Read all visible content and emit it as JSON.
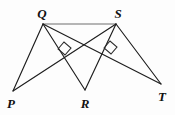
{
  "figure": {
    "background_color": "#fdfdfd",
    "line_color": "#1d1d1d",
    "top_segment_color": "#6f6f6f",
    "label_color": "#111111"
  },
  "vertices": [
    {
      "name": "P",
      "label": "P",
      "x": 13,
      "y": 91,
      "label_x": 11,
      "label_y": 103
    },
    {
      "name": "Q",
      "label": "Q",
      "x": 43,
      "y": 24,
      "label_x": 42,
      "label_y": 13
    },
    {
      "name": "R",
      "label": "R",
      "x": 85,
      "y": 90,
      "label_x": 85,
      "label_y": 103
    },
    {
      "name": "S",
      "label": "S",
      "x": 116,
      "y": 24,
      "label_x": 118,
      "label_y": 13
    },
    {
      "name": "T",
      "label": "T",
      "x": 161,
      "y": 84,
      "label_x": 162,
      "label_y": 96
    }
  ],
  "segments": [
    {
      "name": "segment-QS",
      "from": "Q",
      "to": "S",
      "style": "gray-thin"
    },
    {
      "name": "segment-QP",
      "from": "Q",
      "to": "P",
      "style": "normal"
    },
    {
      "name": "segment-QR",
      "from": "Q",
      "to": "R",
      "style": "normal"
    },
    {
      "name": "segment-QT",
      "from": "Q",
      "to": "T",
      "style": "normal"
    },
    {
      "name": "segment-SP",
      "from": "S",
      "to": "P",
      "style": "normal"
    },
    {
      "name": "segment-SR",
      "from": "S",
      "to": "R",
      "style": "normal"
    },
    {
      "name": "segment-ST",
      "from": "S",
      "to": "T",
      "style": "normal"
    }
  ],
  "right_angle_marks": [
    {
      "name": "right-angle-mark-left",
      "at": "intersection of QR and SP",
      "points": "58,49 64,42 71,48 65,55"
    },
    {
      "name": "right-angle-mark-right",
      "at": "intersection of QT and SR",
      "points": "104,48 110,41 117,47 111,54"
    }
  ],
  "labels": {
    "P": "P",
    "Q": "Q",
    "R": "R",
    "S": "S",
    "T": "T"
  }
}
